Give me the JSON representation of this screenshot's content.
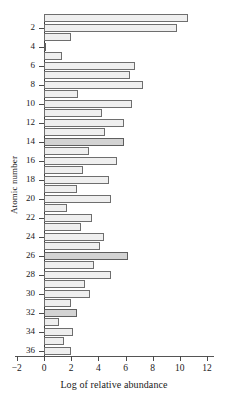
{
  "chart_data": {
    "type": "bar",
    "orientation": "horizontal",
    "title": "",
    "xlabel": "Log of relative abundance",
    "ylabel": "Atomic number",
    "xlim": [
      -2,
      12
    ],
    "ylim": [
      0.5,
      36.5
    ],
    "grid": false,
    "legend": null,
    "xticks": [
      -2,
      0,
      2,
      4,
      6,
      8,
      10,
      12
    ],
    "xtick_labels": [
      "−2",
      "0",
      "2",
      "4",
      "6",
      "8",
      "10",
      "12"
    ],
    "yticks": [
      2,
      4,
      6,
      8,
      10,
      12,
      14,
      16,
      18,
      20,
      22,
      24,
      26,
      28,
      30,
      32,
      34,
      36
    ],
    "ytick_labels": [
      "2",
      "4",
      "6",
      "8",
      "10",
      "12",
      "14",
      "16",
      "18",
      "20",
      "22",
      "24",
      "26",
      "28",
      "30",
      "32",
      "34",
      "36"
    ],
    "categories": [
      1,
      2,
      3,
      4,
      5,
      6,
      7,
      8,
      9,
      10,
      11,
      12,
      13,
      14,
      15,
      16,
      17,
      18,
      19,
      20,
      21,
      22,
      23,
      24,
      25,
      26,
      27,
      28,
      29,
      30,
      31,
      32,
      33,
      34,
      35,
      36
    ],
    "values": [
      10.6,
      9.8,
      2.0,
      0.1,
      1.3,
      6.7,
      6.3,
      7.3,
      2.5,
      6.5,
      4.3,
      5.9,
      4.5,
      5.9,
      3.3,
      5.4,
      2.9,
      4.8,
      2.4,
      4.9,
      1.7,
      3.5,
      2.7,
      4.4,
      4.1,
      6.2,
      3.7,
      4.9,
      3.0,
      3.4,
      2.0,
      2.4,
      1.1,
      2.1,
      1.5,
      2.0
    ],
    "shaded": [
      4,
      14,
      26,
      32
    ],
    "bar_color": "#efefef",
    "bar_shaded_color": "#d3d3d3",
    "bar_edge_color": "#6e6e6e",
    "axis_color": "#4a4a4a"
  }
}
